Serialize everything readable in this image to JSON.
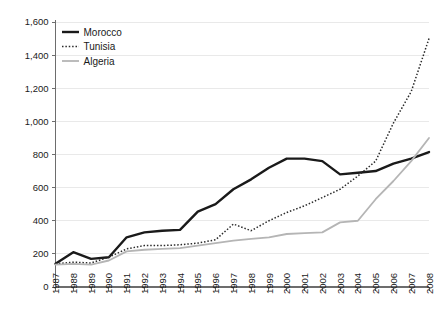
{
  "chart_data": {
    "type": "line",
    "title": "",
    "subtitle": "",
    "xlabel": "",
    "ylabel": "",
    "x": [
      1987,
      1988,
      1989,
      1990,
      1991,
      1992,
      1993,
      1994,
      1995,
      1996,
      1997,
      1998,
      1999,
      2000,
      2001,
      2002,
      2003,
      2004,
      2005,
      2006,
      2007,
      2008
    ],
    "xtick_labels": [
      "1987",
      "1988",
      "1989",
      "1990",
      "1991",
      "1992",
      "1993",
      "1994",
      "1995",
      "1996",
      "1997",
      "1998",
      "1999",
      "2000",
      "2001",
      "2002",
      "2003",
      "2004",
      "2005",
      "2006",
      "2007",
      "2008"
    ],
    "ytick_labels": [
      "0",
      "200",
      "400",
      "600",
      "800",
      "1,000",
      "1,200",
      "1,400",
      "1,600"
    ],
    "ytick_values": [
      0,
      200,
      400,
      600,
      800,
      1000,
      1200,
      1400,
      1600
    ],
    "ylim": [
      0,
      1600
    ],
    "xlim": [
      1987,
      2008
    ],
    "grid": true,
    "grid_axis": "y",
    "legend_position": "top-left",
    "series": [
      {
        "name": "Morocco",
        "color": "#1a1a1a",
        "style": "solid",
        "width": 2.4,
        "values": [
          140,
          210,
          170,
          180,
          300,
          330,
          340,
          345,
          455,
          500,
          590,
          650,
          720,
          775,
          775,
          760,
          680,
          690,
          700,
          745,
          775,
          815
        ]
      },
      {
        "name": "Tunisia",
        "color": "#2b2b2b",
        "style": "dotted",
        "width": 1.5,
        "values": [
          140,
          150,
          145,
          180,
          230,
          250,
          250,
          255,
          265,
          285,
          380,
          340,
          400,
          450,
          490,
          540,
          590,
          670,
          760,
          990,
          1180,
          1500
        ]
      },
      {
        "name": "Algeria",
        "color": "#b5b5b5",
        "style": "solid",
        "width": 1.8,
        "values": [
          135,
          140,
          135,
          160,
          215,
          225,
          230,
          235,
          250,
          265,
          280,
          290,
          300,
          320,
          325,
          330,
          390,
          400,
          530,
          640,
          760,
          900
        ]
      }
    ]
  },
  "legend": {
    "entries": [
      {
        "label": "Morocco"
      },
      {
        "label": "Tunisia"
      },
      {
        "label": "Algeria"
      }
    ]
  },
  "axes": {
    "y_axis_color": "#6d6d6d",
    "x_axis_color": "#6d6d6d",
    "gridline_color": "#e9e9e9"
  }
}
